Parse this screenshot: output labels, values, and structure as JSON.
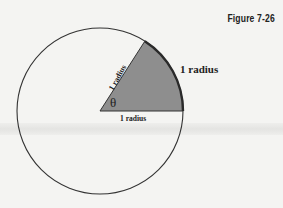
{
  "figure": {
    "label": "Figure 7-26"
  },
  "diagram": {
    "arc_label": "1 radius",
    "slant_side_label": "1 radius",
    "base_label": "1 radius",
    "angle_symbol": "θ",
    "colors": {
      "sector_fill": "#8e8e8e",
      "stroke": "#333333",
      "background": "#f4f4f2"
    }
  }
}
